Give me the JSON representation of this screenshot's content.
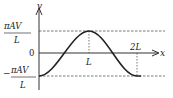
{
  "diagram": {
    "y_axis_label": "v",
    "x_axis_label": "x",
    "top_label": {
      "numerator": "πAV",
      "denominator": "L"
    },
    "zero_label": "0",
    "bottom_label": {
      "sign": "−",
      "numerator": "πAV",
      "denominator": "L"
    },
    "x_ticks": [
      "L",
      "2L"
    ],
    "curve": "cosine-like wave from minimum at x=0 to maximum at x=L back to minimum at x=2L",
    "colors": {
      "line": "#333333",
      "curve": "#222222",
      "dashed": "#555555"
    }
  }
}
